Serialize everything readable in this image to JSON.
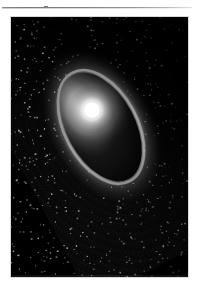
{
  "page": {
    "background_color": "#ffffff",
    "rule": {
      "name": "horizontal-rule",
      "color": "#8d8d8d"
    }
  },
  "figure": {
    "title": "",
    "caption": "",
    "frame": {
      "x": 11,
      "y": 17,
      "width": 177,
      "height": 260,
      "background_color": "#000000",
      "border_color": "#d8d8d8"
    },
    "rendering": "halftone dithered grayscale raster"
  },
  "chart_data": {
    "type": "scatter",
    "title": "",
    "subtitle": "",
    "xlabel": "",
    "ylabel": "",
    "grid": false,
    "legend_position": "none",
    "background_color": "#000000",
    "xlim": [
      0,
      177
    ],
    "ylim": [
      0,
      260
    ],
    "annotations": [],
    "tick_labels": {
      "x": [],
      "y": []
    },
    "core": {
      "name": "bright-core",
      "cx": 81,
      "cy": 93,
      "radius": 17,
      "peak_color": "#ffffff",
      "glow_color": "#d9d9d9"
    },
    "void": {
      "name": "inner-dark-ellipse",
      "cx": 90,
      "cy": 110,
      "rx": 34,
      "ry": 59,
      "rotation_deg": -28,
      "fill_color": "#050505",
      "rim_color": "#bdbdbd"
    },
    "rings": {
      "name": "concentric-elliptical-rings",
      "count": 26,
      "center_x": 90,
      "center_y": 110,
      "rotation_deg": -28,
      "rx_start": 40,
      "ry_start": 66,
      "rx_step": 7.0,
      "ry_step": 9.6,
      "dash_pattern": "1.6 2.2",
      "brightness_range": [
        0.12,
        0.95
      ],
      "brightest_sector_deg": [
        120,
        260
      ],
      "dimmest_sector_deg": [
        300,
        60
      ]
    },
    "series": [
      {
        "name": "ring-brightness-by-index",
        "x": [
          1,
          2,
          3,
          4,
          5,
          6,
          7,
          8,
          9,
          10,
          11,
          12,
          13,
          14,
          15,
          16,
          17,
          18,
          19,
          20,
          21,
          22,
          23,
          24,
          25,
          26
        ],
        "values": [
          0.92,
          0.88,
          0.85,
          0.82,
          0.8,
          0.77,
          0.75,
          0.72,
          0.7,
          0.68,
          0.66,
          0.63,
          0.61,
          0.59,
          0.57,
          0.54,
          0.52,
          0.5,
          0.47,
          0.45,
          0.42,
          0.39,
          0.36,
          0.32,
          0.28,
          0.22
        ]
      },
      {
        "name": "radial-halo-falloff",
        "x": [
          0,
          10,
          20,
          30,
          40,
          55,
          70,
          90,
          110,
          140
        ],
        "values": [
          1.0,
          0.95,
          0.72,
          0.4,
          0.22,
          0.14,
          0.1,
          0.06,
          0.03,
          0.0
        ]
      }
    ]
  }
}
